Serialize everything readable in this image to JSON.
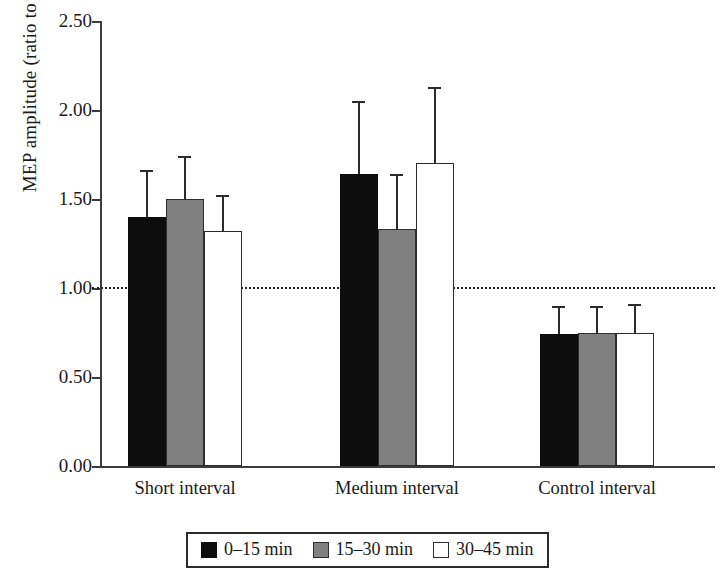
{
  "chart_data": {
    "type": "bar",
    "title": "",
    "xlabel": "",
    "ylabel": "MEP amplitude (ratio to baseline)",
    "categories": [
      "Short interval",
      "Medium interval",
      "Control interval"
    ],
    "ylim": [
      0.0,
      2.5
    ],
    "ytick_labels": [
      "0.00",
      "0.50",
      "1.00",
      "1.50",
      "2.00",
      "2.50"
    ],
    "ytick_values": [
      0.0,
      0.5,
      1.0,
      1.5,
      2.0,
      2.5
    ],
    "grid": false,
    "legend_position": "bottom",
    "reference_line": {
      "value": 1.0,
      "style": "dotted",
      "label": "baseline"
    },
    "series": [
      {
        "name": "0–15 min",
        "color": "#0d0d0d",
        "values": [
          1.4,
          1.64,
          0.74
        ],
        "errors_upper": [
          1.65,
          2.04,
          0.89
        ]
      },
      {
        "name": "15–30 min",
        "color": "#808080",
        "values": [
          1.5,
          1.33,
          0.75
        ],
        "errors_upper": [
          1.73,
          1.63,
          0.89
        ]
      },
      {
        "name": "30–45 min",
        "color": "#ffffff",
        "values": [
          1.32,
          1.7,
          0.75
        ],
        "errors_upper": [
          1.51,
          2.12,
          0.9
        ]
      }
    ]
  },
  "legend": {
    "entries": [
      {
        "label": "0–15 min",
        "swatch": "black"
      },
      {
        "label": "15–30 min",
        "swatch": "gray"
      },
      {
        "label": "30–45 min",
        "swatch": "white"
      }
    ]
  }
}
